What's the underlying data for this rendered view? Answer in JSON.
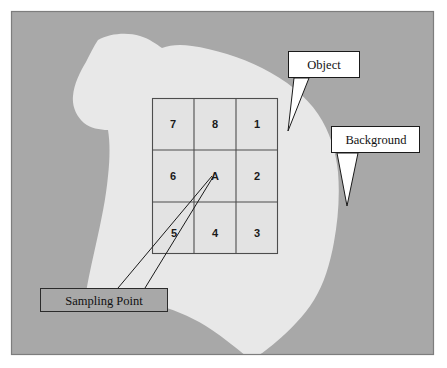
{
  "figure": {
    "frame": {
      "x": 11,
      "y": 11,
      "width": 423,
      "height": 344,
      "border_color": "#7d7d7d"
    },
    "colors": {
      "background_region": "#a8a8a8",
      "object_region": "#e8e8e8",
      "grid_cell_fill": "#e3e3e3",
      "grid_line": "#4d4d4d",
      "callout_fill": "#ffffff",
      "callout_border": "#1a1a1a",
      "leader_line": "#1a1a1a",
      "text": "#111111",
      "page": "#ffffff"
    }
  },
  "grid": {
    "name": "3x3-neighbourhood-grid",
    "x": 152,
    "y": 98,
    "width": 126,
    "height": 156,
    "rows": 3,
    "cols": 3,
    "cells": [
      {
        "label": "7",
        "row": 0,
        "col": 0
      },
      {
        "label": "8",
        "row": 0,
        "col": 1
      },
      {
        "label": "1",
        "row": 0,
        "col": 2
      },
      {
        "label": "6",
        "row": 1,
        "col": 0
      },
      {
        "label": "A",
        "row": 1,
        "col": 1
      },
      {
        "label": "2",
        "row": 1,
        "col": 2
      },
      {
        "label": "5",
        "row": 2,
        "col": 0
      },
      {
        "label": "4",
        "row": 2,
        "col": 1
      },
      {
        "label": "3",
        "row": 2,
        "col": 2
      }
    ]
  },
  "callouts": [
    {
      "id": "object",
      "label": "Object",
      "box": {
        "x": 288,
        "y": 51,
        "width": 72,
        "height": 27
      },
      "tail": {
        "from_x": 294,
        "to_x": 308,
        "tip_x": 288,
        "tip_y": 131
      }
    },
    {
      "id": "background",
      "label": "Background",
      "box": {
        "x": 331,
        "y": 126,
        "width": 89,
        "height": 27
      },
      "tail": {
        "from_x": 337,
        "to_x": 357,
        "tip_x": 347,
        "tip_y": 206
      }
    },
    {
      "id": "sampling-point",
      "label": "Sampling Point",
      "box": {
        "x": 40,
        "y": 288,
        "width": 128,
        "height": 24
      },
      "leader_targets": [
        {
          "start_x": 118,
          "start_y": 288,
          "end_x": 213,
          "end_y": 177
        },
        {
          "start_x": 145,
          "start_y": 288,
          "end_x": 213,
          "end_y": 177
        }
      ]
    }
  ],
  "shape": {
    "name": "object-blob-region",
    "description": "Irregular light-grey object region occupying the centre-left of the frame"
  }
}
